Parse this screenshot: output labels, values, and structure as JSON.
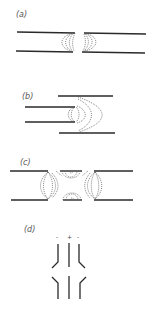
{
  "panels": [
    {
      "label": "(a)",
      "description": "Two collinear coaxial wires with a small gap, fringing field lines at the gap"
    },
    {
      "label": "(b)",
      "description": "Narrow pair entering wider pair, field lines spreading at transition"
    },
    {
      "label": "(c)",
      "description": "Gap in both lines with field loops around the edges"
    },
    {
      "label": "(d)",
      "description": "Three parallel conductors with charge signs, outer rods bent at the gap"
    }
  ],
  "panel_d_signs": [
    "-",
    "+",
    "-"
  ],
  "colors": {
    "line": "#2a2a2a",
    "field": "#555555",
    "text": "#555555"
  }
}
